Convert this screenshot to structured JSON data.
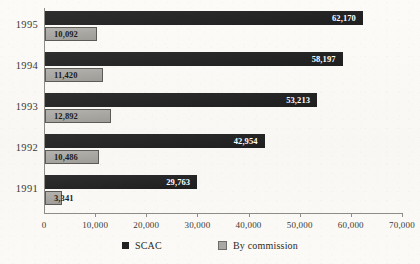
{
  "chart_data": {
    "type": "bar",
    "orientation": "horizontal",
    "title": "",
    "subtitle": "",
    "xlabel": "",
    "ylabel": "",
    "categories": [
      "1995",
      "1994",
      "1993",
      "1992",
      "1991"
    ],
    "series": [
      {
        "name": "SCAC",
        "color": "#232323",
        "values": [
          62170,
          58197,
          53213,
          42954,
          29763
        ],
        "labels": [
          "62,170",
          "58,197",
          "53,213",
          "42,954",
          "29,763"
        ]
      },
      {
        "name": "By commission",
        "color": "#aaa8a3",
        "values": [
          10092,
          11420,
          12892,
          10486,
          3341
        ],
        "labels": [
          "10,092",
          "11,420",
          "12,892",
          "10,486",
          "3,341"
        ]
      }
    ],
    "xlim": [
      0,
      70000
    ],
    "xticks": [
      0,
      10000,
      20000,
      30000,
      40000,
      50000,
      60000,
      70000
    ],
    "xtick_labels": [
      "0",
      "10,000",
      "20,000",
      "30,000",
      "40,000",
      "50,000",
      "60,000",
      "70,000"
    ],
    "grid": false,
    "legend_position": "bottom-center"
  },
  "legend": {
    "items": [
      {
        "label": "SCAC",
        "swatch": "scac-swatch",
        "color": "#232323"
      },
      {
        "label": "By commission",
        "swatch": "commission-swatch",
        "color": "#aaa8a3"
      }
    ]
  }
}
